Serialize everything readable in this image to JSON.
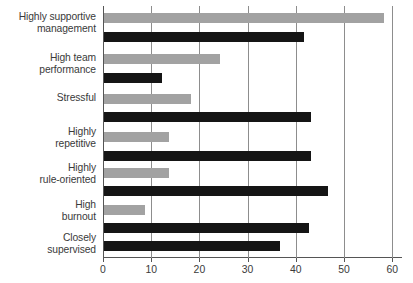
{
  "chart_data": {
    "type": "bar",
    "orientation": "horizontal",
    "title": "",
    "subtitle": "",
    "xlabel": "",
    "ylabel": "",
    "xlim": [
      0,
      62
    ],
    "ylim": null,
    "grid": true,
    "grid_axis": "x",
    "legend": false,
    "legend_position": "none",
    "categories": [
      "Highly supportive management",
      "High team performance",
      "Stressful",
      "Highly repetitive",
      "Highly rule-oriented",
      "High burnout",
      "Closely supervised"
    ],
    "category_lines": [
      [
        "Highly supportive",
        "management"
      ],
      [
        "High team",
        "performance"
      ],
      [
        "Stressful"
      ],
      [
        "Highly",
        "repetitive"
      ],
      [
        "Highly",
        "rule-oriented"
      ],
      [
        "High",
        "burnout"
      ],
      [
        "Closely",
        "supervised"
      ]
    ],
    "series": [
      {
        "name": "series-gray",
        "color": "#a2a2a2",
        "values": [
          58,
          24,
          18,
          13.5,
          13.5,
          8.5,
          null
        ]
      },
      {
        "name": "series-black",
        "color": "#151515",
        "values": [
          41.5,
          12,
          43,
          43,
          46.5,
          42.5,
          36.5
        ]
      }
    ],
    "xticks": [
      0,
      10,
      20,
      30,
      40,
      50,
      60
    ],
    "xtick_labels": [
      "0",
      "10",
      "20",
      "30",
      "40",
      "50",
      "60"
    ]
  },
  "layout": {
    "plot": {
      "left": 103,
      "top": 6,
      "width": 299,
      "height": 252
    },
    "px_per_unit": 4.82,
    "bar_thickness": 10,
    "bars": [
      {
        "y": 7,
        "series": 0,
        "cat": 0
      },
      {
        "y": 26,
        "series": 1,
        "cat": 0
      },
      {
        "y": 48,
        "series": 0,
        "cat": 1
      },
      {
        "y": 67,
        "series": 1,
        "cat": 1
      },
      {
        "y": 88,
        "series": 0,
        "cat": 2
      },
      {
        "y": 106,
        "series": 1,
        "cat": 2
      },
      {
        "y": 126,
        "series": 0,
        "cat": 3
      },
      {
        "y": 145,
        "series": 1,
        "cat": 3
      },
      {
        "y": 162,
        "series": 0,
        "cat": 4
      },
      {
        "y": 180,
        "series": 1,
        "cat": 4
      },
      {
        "y": 199,
        "series": 0,
        "cat": 5
      },
      {
        "y": 217,
        "series": 1,
        "cat": 5
      },
      {
        "y": 235,
        "series": 1,
        "cat": 6
      }
    ],
    "label_tops": [
      11,
      52,
      92,
      126,
      162,
      199,
      232
    ]
  }
}
